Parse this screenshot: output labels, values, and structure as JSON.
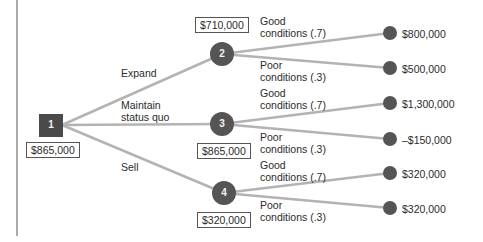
{
  "colors": {
    "line": "#b3b3b3",
    "node_fill": "#555555",
    "decision_fill": "#4a4a4a",
    "text": "#2b2b2b",
    "frame": "#555555"
  },
  "decision_node": {
    "number": "1",
    "value": "$865,000"
  },
  "alternatives": [
    {
      "label": "Expand",
      "node": "2",
      "value": "$710,000"
    },
    {
      "label": "Maintain\nstatus quo",
      "node": "3",
      "value": "$865,000"
    },
    {
      "label": "Sell",
      "node": "4",
      "value": "$320,000"
    }
  ],
  "outcomes": [
    {
      "parent": "2",
      "condition": "Good\nconditions (.7)",
      "payoff": "$800,000"
    },
    {
      "parent": "2",
      "condition": "Poor\nconditions (.3)",
      "payoff": "$500,000"
    },
    {
      "parent": "3",
      "condition": "Good\nconditions (.7)",
      "payoff": "$1,300,000"
    },
    {
      "parent": "3",
      "condition": "Poor\nconditions (.3)",
      "payoff": "–$150,000"
    },
    {
      "parent": "4",
      "condition": "Good\nconditions (.7)",
      "payoff": "$320,000"
    },
    {
      "parent": "4",
      "condition": "Poor\nconditions (.3)",
      "payoff": "$320,000"
    }
  ]
}
